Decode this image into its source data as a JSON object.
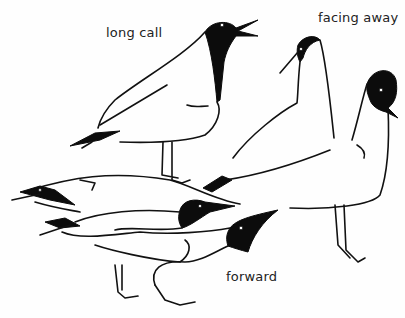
{
  "figure": {
    "labels": {
      "long_call": "long call",
      "facing_away": "facing away",
      "forward": "forward"
    },
    "colors": {
      "ink": "#111111",
      "background": "#fefefe"
    }
  }
}
